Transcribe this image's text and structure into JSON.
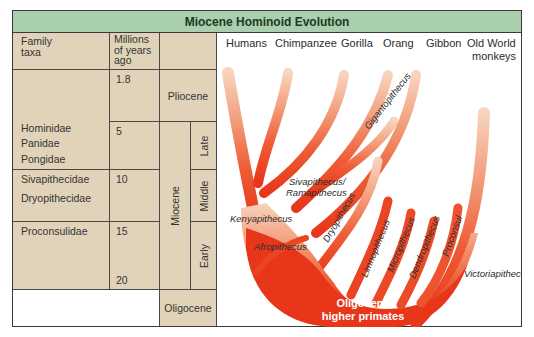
{
  "title": "Miocene Hominoid Evolution",
  "table": {
    "headers": {
      "family": "Family taxa",
      "family_l1": "Family",
      "family_l2": "taxa",
      "mya_l1": "Millions",
      "mya_l2": "of years",
      "mya_l3": "ago"
    },
    "mya_ticks": [
      "1.8",
      "5",
      "10",
      "15",
      "20"
    ],
    "families": {
      "hominidae": "Hominidae",
      "panidae": "Panidae",
      "pongidae": "Pongidae",
      "sivapithecidae": "Sivapithecidae",
      "dryopithecidae": "Dryopithecidae",
      "proconsulidae": "Proconsulidae"
    },
    "epochs": {
      "pliocene": "Pliocene",
      "miocene": "Miocene",
      "oligocene": "Oligocene"
    },
    "subepochs": {
      "late": "Late",
      "middle": "Middle",
      "early": "Early"
    }
  },
  "diagram": {
    "living_taxa": [
      "Humans",
      "Chimpanzee",
      "Gorilla",
      "Orang",
      "Gibbon",
      "Old World",
      "monkeys"
    ],
    "fossil_taxa": {
      "gigantopithecus": "Gigantopithecus",
      "sivapithecus_l1": "Sivapithecus/",
      "sivapithecus_l2": "Ramapithecus",
      "kenyapithecus": "Kenyapithecus",
      "afropithecus": "Afropithecus",
      "dryopithecus": "Dryopithecus",
      "limnopithecus": "Limnopithecus",
      "micropithecus": "Micropithecus",
      "dendropithecus": "Dendropithecus",
      "proconsul": "Proconsul",
      "victoriapithecus": "Victoriapithecus"
    },
    "root_l1": "Oligocene",
    "root_l2": "higher primates",
    "colors": {
      "header": "#a9cfae",
      "table_fill": "#e1d3b9",
      "branch_base": "#e8361b",
      "branch_tip": "#f7c9ae"
    }
  }
}
